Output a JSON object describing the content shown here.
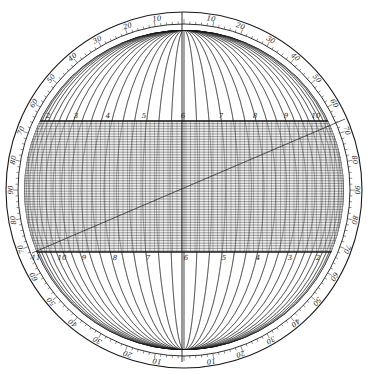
{
  "diagram": {
    "type": "spherical-projection-net",
    "center": [
      184,
      190
    ],
    "outer_radius": 178,
    "scale_inner_radius": 166,
    "sphere_radius": 160,
    "colors": {
      "line": "#1a1a1a",
      "background": "#ffffff",
      "band_fill": "#e6e6e6"
    },
    "rim_labels": [
      {
        "text": "10",
        "angle": -9
      },
      {
        "text": "20",
        "angle": -19
      },
      {
        "text": "30",
        "angle": -30
      },
      {
        "text": "40",
        "angle": -40
      },
      {
        "text": "50",
        "angle": -50
      },
      {
        "text": "60",
        "angle": -60
      },
      {
        "text": "70",
        "angle": -70
      },
      {
        "text": "80",
        "angle": -80
      },
      {
        "text": "90",
        "angle": -90
      },
      {
        "text": "80",
        "angle": -100
      },
      {
        "text": "70",
        "angle": -110
      },
      {
        "text": "60",
        "angle": -120
      },
      {
        "text": "50",
        "angle": -130
      },
      {
        "text": "40",
        "angle": -140
      },
      {
        "text": "30",
        "angle": -150
      },
      {
        "text": "20",
        "angle": -161
      },
      {
        "text": "10",
        "angle": -171
      },
      {
        "text": "10",
        "angle": 9
      },
      {
        "text": "20",
        "angle": 19
      },
      {
        "text": "30",
        "angle": 30
      },
      {
        "text": "40",
        "angle": 40
      },
      {
        "text": "50",
        "angle": 50
      },
      {
        "text": "60",
        "angle": 60
      },
      {
        "text": "70",
        "angle": 70
      },
      {
        "text": "80",
        "angle": 80
      },
      {
        "text": "90",
        "angle": 90
      },
      {
        "text": "80",
        "angle": 100
      },
      {
        "text": "70",
        "angle": 110
      },
      {
        "text": "60",
        "angle": 120
      },
      {
        "text": "50",
        "angle": 130
      },
      {
        "text": "40",
        "angle": 140
      },
      {
        "text": "30",
        "angle": 150
      },
      {
        "text": "20",
        "angle": 161
      },
      {
        "text": "10",
        "angle": 171
      }
    ],
    "band": {
      "top_y": 121,
      "bottom_y": 252
    },
    "upper_band_labels": [
      "2",
      "3",
      "4",
      "5",
      "6",
      "7",
      "8",
      "9",
      "10"
    ],
    "lower_band_labels": [
      "11",
      "10",
      "9",
      "8",
      "7",
      "6",
      "5",
      "4",
      "3",
      "2"
    ],
    "diagonal": {
      "from": [
        32,
        253
      ],
      "to": [
        345,
        119
      ]
    }
  }
}
